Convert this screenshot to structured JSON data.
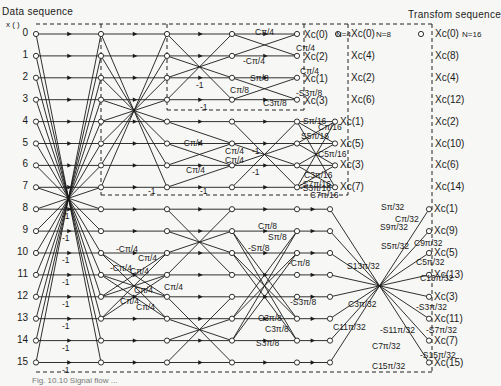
{
  "headers": {
    "data_sequence": "Data sequence",
    "x_paren": "x (   )",
    "transform_sequence": "Transfom sequence"
  },
  "inputs": [
    "0",
    "1",
    "2",
    "3",
    "4",
    "5",
    "6",
    "7",
    "8",
    "9",
    "10",
    "11",
    "12",
    "13",
    "14",
    "15"
  ],
  "outputs": {
    "n4": {
      "label": "N=4",
      "items": [
        "Xc(0)",
        "Xc(2)",
        "Xc(1)",
        "Xc(3)"
      ]
    },
    "n8": {
      "label": "N=8",
      "items": [
        "Xc(0)",
        "Xc(4)",
        "Xc(2)",
        "Xc(6)",
        "Xc(1)",
        "Xc(5)",
        "Xc(3)",
        "Xc(7)"
      ]
    },
    "n16": {
      "label": "N=16",
      "items": [
        "Xc(0)",
        "Xc(8)",
        "Xc(4)",
        "Xc(12)",
        "Xc(2)",
        "Xc(10)",
        "Xc(6)",
        "Xc(14)",
        "Xc(1)",
        "Xc(9)",
        "Xc(5)",
        "Xc(13)",
        "Xc(3)",
        "Xc(11)",
        "Xc(7)",
        "Xc(15)"
      ]
    },
    "n16_bottom": [
      "Xc(1)",
      "Xc(9)",
      "Xc(5)",
      "Xc(13)",
      "Xc(3)",
      "Xc(11)",
      "Xc(7)",
      "Xc(15)"
    ],
    "n8_bottom": [
      "Xc(1)",
      "Xc(5)",
      "Xc(3)",
      "Xc(7)"
    ]
  },
  "coefficients": {
    "n4_block": [
      "Cπ/4",
      "Cπ/4",
      "-Cπ/4",
      "Cπ/4",
      "Sπ/8",
      "Cπ/8",
      "-S3π/8",
      "C3π/8",
      "-1",
      "-1"
    ],
    "n8_block": [
      "-Cπ/4",
      "Cπ/4",
      "Cπ/4",
      "Cπ/4",
      "-1",
      "-1",
      "-1",
      "-1",
      "Sπ/16",
      "Cπ/16",
      "S5π/16",
      "C5π/16",
      "C3π/16",
      "-S3π/16",
      "-S7π/16",
      "C7π/16"
    ],
    "n16_block_stage2": [
      "-Cπ/4",
      "Cπ/4",
      "-Cπ/4",
      "Cπ/4",
      "Cπ/4",
      "Cπ/4",
      "Cπ/4",
      "Cπ/4"
    ],
    "n16_block_stage3": [
      "Cπ/8",
      "Sπ/8",
      "-Sπ/8",
      "-Cπ/8",
      "-S3π/8",
      "C3π/8",
      "C3π/8",
      "S3π/8"
    ],
    "n16_block_stage4": [
      "Sπ/32",
      "Cπ/32",
      "S9π/32",
      "C9π/32",
      "S5π/32",
      "C5π/32",
      "S13π/32",
      "C13π/32",
      "C3π/32",
      "-S3π/32",
      "C11π/32",
      "-S11π/32",
      "-S7π/32",
      "C7π/32",
      "-S15π/32",
      "C15π/32"
    ],
    "first_stage_minus": [
      "-1",
      "-1",
      "-1",
      "-1",
      "-1",
      "-1",
      "-1",
      "-1"
    ]
  },
  "caption_partial": "Fig. 10.10  Signal flow ..."
}
